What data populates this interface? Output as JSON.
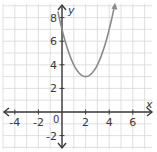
{
  "chart_data": {
    "type": "line",
    "title": "",
    "xlabel": "x",
    "ylabel": "y",
    "function": "y = (x - 2)^2 + 3",
    "series": [
      {
        "name": "parabola",
        "x": [
          0,
          0.5,
          1,
          1.5,
          2,
          2.5,
          3,
          3.5,
          4,
          4.45
        ],
        "values": [
          7,
          5.25,
          4,
          3.25,
          3,
          3.25,
          4,
          5.25,
          7,
          9
        ]
      }
    ],
    "vertex": [
      2,
      3
    ],
    "y_intercept": 7,
    "xlim": [
      -5,
      6.5
    ],
    "ylim": [
      -3,
      9
    ],
    "x_ticks": [
      "-4",
      "-2",
      "2",
      "4",
      "6"
    ],
    "y_ticks": [
      "8",
      "6",
      "4",
      "2",
      "-2"
    ],
    "origin_label": "0",
    "grid": true,
    "colors": {
      "curve": "#8a8a8a",
      "axis": "#3a3a3a",
      "grid": "#d8d8d8"
    }
  }
}
